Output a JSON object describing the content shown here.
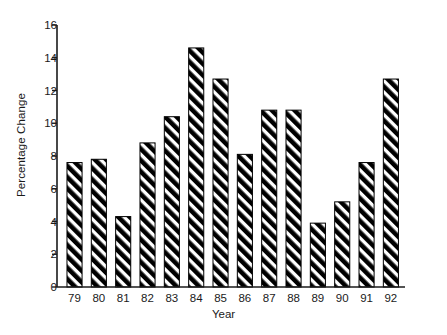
{
  "chart_data": {
    "type": "bar",
    "title": "",
    "xlabel": "Year",
    "ylabel": "Percentage Change",
    "categories": [
      "79",
      "80",
      "81",
      "82",
      "83",
      "84",
      "85",
      "86",
      "87",
      "88",
      "89",
      "90",
      "91",
      "92"
    ],
    "values": [
      7.6,
      7.8,
      4.3,
      8.8,
      10.4,
      14.6,
      12.7,
      8.1,
      10.8,
      10.8,
      3.9,
      5.2,
      7.6,
      12.7
    ],
    "ylim": [
      0,
      16
    ],
    "ytick_labels": [
      "0",
      "2",
      "4",
      "6",
      "8",
      "10",
      "12",
      "14",
      "16"
    ],
    "ytick_values": [
      0,
      2,
      4,
      6,
      8,
      10,
      12,
      14,
      16
    ],
    "grid": false,
    "legend": null,
    "bar_fill": "hatch-diagonal-black",
    "bar_color": "#000000",
    "axis_color": "#1a1a1a",
    "background": "#ffffff"
  }
}
